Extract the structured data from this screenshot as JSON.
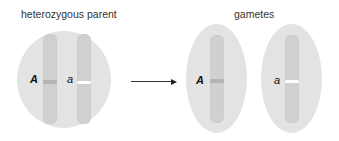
{
  "diagram": {
    "parent": {
      "title": "heterozygous parent",
      "chromosomes": [
        {
          "allele": "A",
          "allele_type": "dominant"
        },
        {
          "allele": "a",
          "allele_type": "recessive"
        }
      ]
    },
    "arrow": {
      "direction": "right"
    },
    "gametes": {
      "title": "gametes",
      "cells": [
        {
          "allele": "A",
          "allele_type": "dominant"
        },
        {
          "allele": "a",
          "allele_type": "recessive"
        }
      ]
    },
    "colors": {
      "cell_fill": "#e3e3e3",
      "chromosome_fill": "#d0d0d0",
      "dominant_band": "#b4b4b4",
      "recessive_band": "#ffffff",
      "text": "#333333"
    }
  }
}
